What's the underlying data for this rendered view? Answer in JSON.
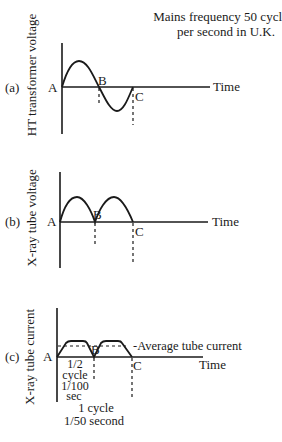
{
  "header": {
    "note_line1": "Mains frequency 50 cycles",
    "note_line2": "per second in U.K."
  },
  "panels": [
    {
      "tag": "(a)",
      "ylabel": "HT transformer voltage",
      "origin": "A",
      "mid_point": "B",
      "end_point": "C",
      "xlabel": "Time",
      "waveform": "full sine (one positive and one negative half-cycle)"
    },
    {
      "tag": "(b)",
      "ylabel": "X-ray tube voltage",
      "origin": "A",
      "mid_point": "B",
      "end_point": "C",
      "xlabel": "Time",
      "waveform": "full-wave rectified (two positive half-cycles)"
    },
    {
      "tag": "(c)",
      "ylabel": "X-ray tube current",
      "origin": "A",
      "mid_point": "B",
      "end_point": "C",
      "xlabel": "Time",
      "waveform": "rectified with flat plateaus",
      "average_label": "-Average tube current",
      "half_cycle_lines": [
        "1/2",
        "cycle",
        "1/100",
        "sec"
      ],
      "full_cycle_lines": [
        "1 cycle",
        "1/50 second"
      ]
    }
  ]
}
